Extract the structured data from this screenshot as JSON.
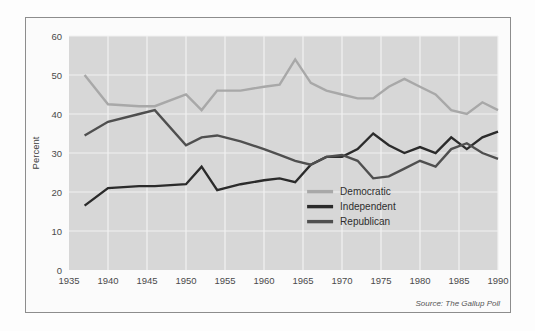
{
  "figure": {
    "source_note": "Source: The Gallup Poll",
    "background_color": "#ffffff",
    "frame_color": "#8d8d8d"
  },
  "chart_data": {
    "type": "line",
    "title": "",
    "xlabel": "",
    "ylabel": "Percent",
    "xlim": [
      1935,
      1990
    ],
    "ylim": [
      0,
      60
    ],
    "xticks": [
      1935,
      1940,
      1945,
      1950,
      1955,
      1960,
      1965,
      1970,
      1975,
      1980,
      1985,
      1990
    ],
    "yticks": [
      0,
      10,
      20,
      30,
      40,
      50,
      60
    ],
    "grid": true,
    "plot_background": "#d7d7d7",
    "gridline_color": "#f2f2f2",
    "legend_position": "inside-lower-right",
    "series": [
      {
        "name": "Democratic",
        "color": "#a8a8a8",
        "x": [
          1937,
          1940,
          1944,
          1946,
          1950,
          1952,
          1954,
          1957,
          1960,
          1962,
          1964,
          1966,
          1968,
          1970,
          1972,
          1974,
          1976,
          1978,
          1980,
          1982,
          1984,
          1986,
          1988,
          1990
        ],
        "values": [
          50,
          42.5,
          42,
          42,
          45,
          41,
          46,
          46,
          47,
          47.5,
          54,
          48,
          46,
          45,
          44,
          44,
          47,
          49,
          47,
          45,
          41,
          40,
          43,
          41
        ]
      },
      {
        "name": "Independent",
        "color": "#2b2b2b",
        "x": [
          1937,
          1940,
          1944,
          1946,
          1950,
          1952,
          1954,
          1957,
          1960,
          1962,
          1964,
          1966,
          1968,
          1970,
          1972,
          1974,
          1976,
          1978,
          1980,
          1982,
          1984,
          1986,
          1988,
          1990
        ],
        "values": [
          16.5,
          21,
          21.5,
          21.5,
          22,
          26.5,
          20.5,
          22,
          23,
          23.5,
          22.5,
          27,
          29,
          29,
          31,
          35,
          32,
          30,
          31.5,
          30,
          34,
          31,
          34,
          35.5
        ]
      },
      {
        "name": "Republican",
        "color": "#4f4f4f",
        "x": [
          1937,
          1940,
          1944,
          1946,
          1950,
          1952,
          1954,
          1957,
          1960,
          1962,
          1964,
          1966,
          1968,
          1970,
          1972,
          1974,
          1976,
          1978,
          1980,
          1982,
          1984,
          1986,
          1988,
          1990
        ],
        "values": [
          34.5,
          38,
          40,
          41,
          32,
          34,
          34.5,
          33,
          31,
          29.5,
          28,
          27,
          29,
          29.5,
          28,
          23.5,
          24,
          26,
          28,
          26.5,
          31,
          32.5,
          30,
          28.5
        ]
      }
    ]
  },
  "legend": {
    "items": [
      {
        "label": "Democratic",
        "color": "#a8a8a8"
      },
      {
        "label": "Independent",
        "color": "#2b2b2b"
      },
      {
        "label": "Republican",
        "color": "#4f4f4f"
      }
    ]
  }
}
